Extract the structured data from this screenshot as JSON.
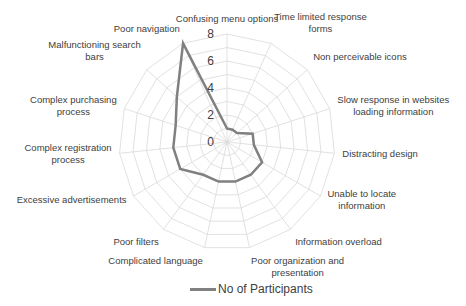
{
  "chart_data": {
    "type": "radar",
    "title": "",
    "categories": [
      "Confusing menu options",
      "Time limited response forms",
      "Non perceivable icons",
      "Slow response in websites loading information",
      "Distracting design",
      "Unable to locate information",
      "Information overload",
      "Poor organization and presentation",
      "Complicated language",
      "Poor filters",
      "Excessive advertisements",
      "Complex registration process",
      "Complex purchasing process",
      "Malfunctioning search bars",
      "Poor navigation"
    ],
    "label_lines": [
      [
        "Confusing menu options"
      ],
      [
        "Time limited response",
        "forms"
      ],
      [
        "Non perceivable icons"
      ],
      [
        "Slow response in websites",
        "loading information"
      ],
      [
        "Distracting design"
      ],
      [
        "Unable to locate",
        "information"
      ],
      [
        "Information overload"
      ],
      [
        "Poor organization and",
        "presentation"
      ],
      [
        "Complicated language"
      ],
      [
        "Poor filters"
      ],
      [
        "Excessive advertisements"
      ],
      [
        "Complex registration",
        "process"
      ],
      [
        "Complex purchasing",
        "process"
      ],
      [
        "Malfunctioning search",
        "bars"
      ],
      [
        "Poor navigation"
      ]
    ],
    "series": [
      {
        "name": "No of Participants",
        "values": [
          1,
          1,
          1,
          2,
          2,
          3,
          3,
          3,
          3,
          3,
          4,
          4,
          4,
          5,
          8
        ],
        "color": "#808080"
      }
    ],
    "rlim": [
      0,
      8
    ],
    "ticks": [
      0,
      2,
      4,
      6,
      8
    ],
    "tick_labels": [
      "0",
      "2",
      "4",
      "6",
      "8"
    ],
    "grid": true,
    "legend_position": "bottom"
  },
  "legend": {
    "label": "No of Participants"
  }
}
